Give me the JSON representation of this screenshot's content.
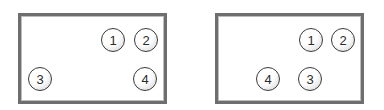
{
  "colors": {
    "border": "#6e6e6e",
    "node_outline": "#3a3a3a",
    "node_text": "#2a2a2a",
    "background": "#ffffff"
  },
  "panels": [
    {
      "name": "left-arrangement",
      "box": {
        "x": 18,
        "y": 13,
        "w": 149,
        "h": 91
      },
      "nodes": [
        {
          "label": "1",
          "cx": 113,
          "cy": 40
        },
        {
          "label": "2",
          "cx": 146,
          "cy": 40
        },
        {
          "label": "3",
          "cx": 40,
          "cy": 79
        },
        {
          "label": "4",
          "cx": 145,
          "cy": 79
        }
      ]
    },
    {
      "name": "right-arrangement",
      "box": {
        "x": 215,
        "y": 13,
        "w": 149,
        "h": 91
      },
      "nodes": [
        {
          "label": "1",
          "cx": 311,
          "cy": 40
        },
        {
          "label": "2",
          "cx": 343,
          "cy": 40
        },
        {
          "label": "4",
          "cx": 268,
          "cy": 79
        },
        {
          "label": "3",
          "cx": 310,
          "cy": 79
        }
      ]
    }
  ]
}
